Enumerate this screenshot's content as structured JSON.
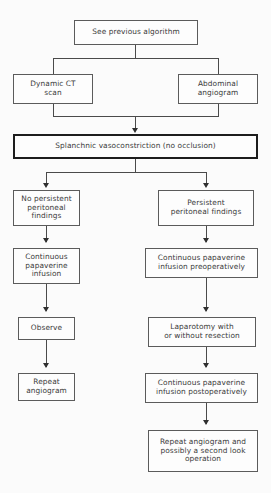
{
  "diagram": {
    "type": "flowchart",
    "background_color": "#fbfbfb",
    "box_border_color": "#5b5b5b",
    "emphasis_border_color": "#1d1d1d",
    "connector_color": "#4a4a4a",
    "text_color": "#3a3a3a",
    "nodes": [
      {
        "id": "see-previous-algorithm",
        "label": "See previous algorithm"
      },
      {
        "id": "dynamic-ct-scan",
        "label": "Dynamic CT\nscan"
      },
      {
        "id": "abdominal-angiogram",
        "label": "Abdominal\nangiogram"
      },
      {
        "id": "splanchnic-vasoconstriction",
        "label": "Splanchnic vasoconstriction (no occlusion)"
      },
      {
        "id": "no-persistent-peritoneal-findings",
        "label": "No persistent\nperitoneal\nfindings"
      },
      {
        "id": "persistent-peritoneal-findings",
        "label": "Persistent\nperitoneal findings"
      },
      {
        "id": "continuous-papaverine-infusion",
        "label": "Continuous\npapaverine\ninfusion"
      },
      {
        "id": "continuous-papaverine-infusion-preoperatively",
        "label": "Continuous papaverine\ninfusion preoperatively"
      },
      {
        "id": "observe",
        "label": "Observe"
      },
      {
        "id": "laparotomy-with-or-without-resection",
        "label": "Laparotomy with\nor without resection"
      },
      {
        "id": "repeat-angiogram",
        "label": "Repeat\nangiogram"
      },
      {
        "id": "continuous-papaverine-infusion-postoperatively",
        "label": "Continuous papaverine\ninfusion postoperatively"
      },
      {
        "id": "repeat-angiogram-second-look",
        "label": "Repeat angiogram and\npossibly a second look\noperation"
      }
    ],
    "caption": ""
  }
}
